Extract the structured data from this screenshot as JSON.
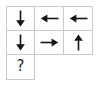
{
  "puzzle": {
    "title": "Arrow Direction Grid",
    "background_color": "#ffffff",
    "grid_line_color": "#c9c9c9",
    "glyph_color": "#151515",
    "question_color": "#2a2a2a",
    "rows": 3,
    "columns": 3,
    "cells": [
      [
        {
          "name": "cell-r1c1",
          "symbol": "↓",
          "icon": "arrow-down-icon",
          "present": true
        },
        {
          "name": "cell-r1c2",
          "symbol": "←",
          "icon": "arrow-left-icon",
          "present": true
        },
        {
          "name": "cell-r1c3",
          "symbol": "←",
          "icon": "arrow-left-icon",
          "present": true
        }
      ],
      [
        {
          "name": "cell-r2c1",
          "symbol": "↓",
          "icon": "arrow-down-icon",
          "present": true
        },
        {
          "name": "cell-r2c2",
          "symbol": "→",
          "icon": "arrow-right-icon",
          "present": true
        },
        {
          "name": "cell-r2c3",
          "symbol": "↑",
          "icon": "arrow-up-icon",
          "present": true
        }
      ],
      [
        {
          "name": "cell-r3c1",
          "symbol": "?",
          "icon": "question-mark-icon",
          "present": true
        },
        {
          "name": "cell-r3c2",
          "symbol": "",
          "icon": "",
          "present": false
        },
        {
          "name": "cell-r3c3",
          "symbol": "",
          "icon": "",
          "present": false
        }
      ]
    ],
    "question_label": "?"
  }
}
